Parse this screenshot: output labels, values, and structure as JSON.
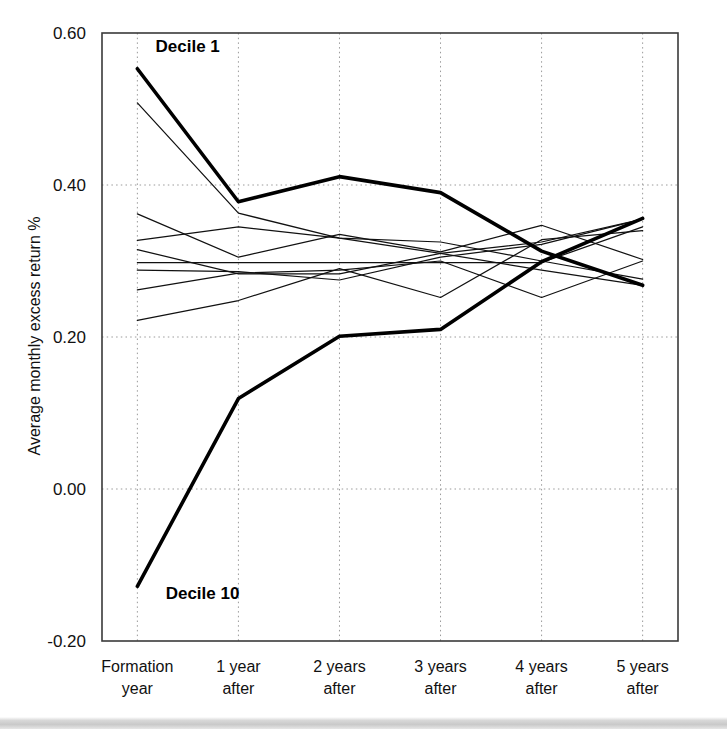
{
  "chart_data": {
    "type": "line",
    "title": "",
    "subtitle": "",
    "xlabel": "",
    "ylabel": "Average monthly excess return %",
    "categories": [
      "Formation year",
      "1 year after",
      "2 years after",
      "3 years after",
      "4 years after",
      "5 years after"
    ],
    "x": [
      0,
      1,
      2,
      3,
      4,
      5
    ],
    "xlim": [
      -0.35,
      5.35
    ],
    "ylim": [
      -0.2,
      0.6
    ],
    "yticks": [
      -0.2,
      0.0,
      0.2,
      0.4,
      0.6
    ],
    "ytick_labels": [
      "-0.20",
      "0.00",
      "0.20",
      "0.40",
      "0.60"
    ],
    "grid": true,
    "grid_style": "dotted",
    "legend": "none",
    "annotations": [
      {
        "text": "Decile 1",
        "x": 0.18,
        "y": 0.575,
        "series": "Decile 1"
      },
      {
        "text": "Decile 10",
        "x": 0.28,
        "y": -0.145,
        "series": "Decile 10"
      }
    ],
    "series": [
      {
        "name": "Decile 1",
        "emphasis": "thick",
        "values": [
          0.553,
          0.378,
          0.411,
          0.39,
          0.313,
          0.268
        ]
      },
      {
        "name": "Decile 2",
        "emphasis": "thin",
        "values": [
          0.508,
          0.363,
          0.33,
          0.31,
          0.288,
          0.268
        ]
      },
      {
        "name": "Decile 3",
        "emphasis": "thin",
        "values": [
          0.362,
          0.305,
          0.335,
          0.312,
          0.347,
          0.302
        ]
      },
      {
        "name": "Decile 4",
        "emphasis": "thin",
        "values": [
          0.327,
          0.345,
          0.33,
          0.325,
          0.3,
          0.276
        ]
      },
      {
        "name": "Decile 5",
        "emphasis": "thin",
        "values": [
          0.315,
          0.283,
          0.283,
          0.31,
          0.325,
          0.355
        ]
      },
      {
        "name": "Decile 6",
        "emphasis": "thin",
        "values": [
          0.298,
          0.298,
          0.298,
          0.298,
          0.298,
          0.345
        ]
      },
      {
        "name": "Decile 7",
        "emphasis": "thin",
        "values": [
          0.288,
          0.286,
          0.275,
          0.305,
          0.322,
          0.355
        ]
      },
      {
        "name": "Decile 8",
        "emphasis": "thin",
        "values": [
          0.262,
          0.284,
          0.288,
          0.3,
          0.252,
          0.3
        ]
      },
      {
        "name": "Decile 9",
        "emphasis": "thin",
        "values": [
          0.222,
          0.248,
          0.29,
          0.252,
          0.328,
          0.34
        ]
      },
      {
        "name": "Decile 10",
        "emphasis": "thick",
        "values": [
          -0.128,
          0.119,
          0.201,
          0.21,
          0.299,
          0.356
        ]
      }
    ]
  },
  "axis": {
    "y_title": "Average monthly excess return %"
  },
  "xtick_lines": [
    [
      "Formation",
      "year"
    ],
    [
      "1 year",
      "after"
    ],
    [
      "2 years",
      "after"
    ],
    [
      "3 years",
      "after"
    ],
    [
      "4 years",
      "after"
    ],
    [
      "5 years",
      "after"
    ]
  ],
  "colors": {
    "background": "#ffffff",
    "line": "#000000",
    "grid": "#9a9a9a",
    "frame": "#3a3a3a",
    "text": "#111111"
  }
}
